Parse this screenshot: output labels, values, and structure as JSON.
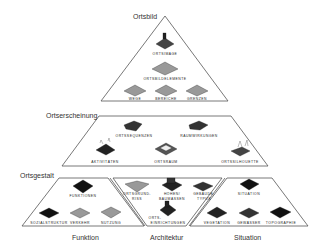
{
  "diagram": {
    "levels": [
      {
        "title": "Ortsbild",
        "items": [
          {
            "label": "ORTSIMAGE",
            "icon": "townscape-icon"
          },
          {
            "label": "ORTSBILDELEMENTE",
            "icon": "grid-terrain-icon"
          },
          {
            "label": "WEGE",
            "icon": "grid-terrain-icon"
          },
          {
            "label": "BEREICHE",
            "icon": "grid-terrain-icon"
          },
          {
            "label": "GRENZEN",
            "icon": "grid-terrain-icon"
          }
        ]
      },
      {
        "title": "Ortserscheinung",
        "items": [
          {
            "label": "ORTSSEQUENZEN",
            "icon": "sequence-icon"
          },
          {
            "label": "RAUMWIRKUNGEN",
            "icon": "space-effect-icon"
          },
          {
            "label": "AKTIVITÄTEN",
            "icon": "activities-icon"
          },
          {
            "label": "ORTSRAUM",
            "icon": "place-space-icon"
          },
          {
            "label": "ORTSSILHOUETTE",
            "icon": "silhouette-icon"
          }
        ]
      },
      {
        "title": "Ortsgestalt",
        "groups": [
          {
            "caption": "Funktion",
            "items": [
              {
                "label": "FUNKTIONEN",
                "icon": "function-icon"
              },
              {
                "label": "SOZIALSTRUKTUR",
                "icon": "social-structure-icon"
              },
              {
                "label": "VERKEHR",
                "icon": "traffic-icon"
              },
              {
                "label": "NUTZUNG",
                "icon": "usage-icon"
              }
            ]
          },
          {
            "caption": "Architektur",
            "items": [
              {
                "label": "ORTSGRUND-",
                "label2": "RISS",
                "icon": "ground-plan-icon"
              },
              {
                "label": "HÖHEN/",
                "label2": "BAUMASSEN",
                "icon": "building-mass-icon"
              },
              {
                "label": "GEBÄUDE-",
                "label2": "TYPUS",
                "icon": "building-type-icon"
              },
              {
                "label": "ORTS-",
                "label2": "EINRICHTUNGEN",
                "icon": "facilities-icon"
              }
            ]
          },
          {
            "caption": "Situation",
            "items": [
              {
                "label": "SITUATION",
                "icon": "situation-icon"
              },
              {
                "label": "VEGETATION",
                "icon": "vegetation-icon"
              },
              {
                "label": "GEWÄSSER",
                "icon": "water-icon"
              },
              {
                "label": "TOPOGRAPHIE",
                "icon": "topography-icon"
              }
            ]
          }
        ]
      }
    ]
  }
}
